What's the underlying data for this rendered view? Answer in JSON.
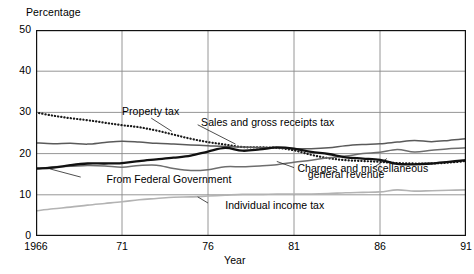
{
  "chart_data": {
    "type": "line",
    "title": "",
    "ylabel": "Percentage",
    "xlabel": "Year",
    "ylim": [
      0,
      50
    ],
    "yticks": [
      0,
      10,
      20,
      30,
      40,
      50
    ],
    "xlim": [
      1966,
      1991
    ],
    "xticks": [
      1966,
      1971,
      1976,
      1981,
      1986,
      1991
    ],
    "xtick_labels": [
      "1966",
      "71",
      "76",
      "81",
      "86",
      "91"
    ],
    "grid": true,
    "legend_position": "inline-annotations",
    "x": [
      1966,
      1967,
      1968,
      1969,
      1970,
      1971,
      1972,
      1973,
      1974,
      1975,
      1976,
      1977,
      1978,
      1979,
      1980,
      1981,
      1982,
      1983,
      1984,
      1985,
      1986,
      1987,
      1988,
      1989,
      1990,
      1991
    ],
    "series": [
      {
        "name": "Property tax",
        "style": "dotted",
        "color": "#1a1a1a",
        "values": [
          30.0,
          29.2,
          28.6,
          28.1,
          27.5,
          26.9,
          26.4,
          25.6,
          24.6,
          23.6,
          22.8,
          22.2,
          21.6,
          21.5,
          21.4,
          20.8,
          19.7,
          18.9,
          18.4,
          18.2,
          18.0,
          17.7,
          17.6,
          17.6,
          17.8,
          18.2
        ]
      },
      {
        "name": "Sales and gross receipts tax",
        "style": "solid-gray",
        "color": "#5a5a5a",
        "values": [
          22.6,
          22.4,
          22.5,
          22.3,
          22.7,
          23.0,
          22.8,
          22.5,
          22.3,
          22.1,
          21.9,
          21.7,
          21.6,
          21.5,
          21.4,
          21.2,
          21.2,
          21.4,
          21.9,
          22.2,
          22.4,
          22.8,
          23.2,
          22.9,
          23.2,
          23.6
        ]
      },
      {
        "name": "Charges and miscellaneous general revenue",
        "style": "solid-medium-gray",
        "color": "#6e6e6e",
        "values": [
          16.2,
          16.8,
          16.9,
          17.1,
          17.0,
          16.7,
          17.1,
          17.2,
          16.4,
          15.9,
          16.1,
          16.8,
          16.8,
          17.0,
          17.3,
          17.9,
          18.4,
          19.0,
          19.4,
          20.0,
          20.3,
          21.0,
          20.4,
          20.8,
          21.2,
          21.4
        ]
      },
      {
        "name": "From Federal Government",
        "style": "solid-black-thick",
        "color": "#111111",
        "values": [
          16.4,
          16.6,
          17.2,
          17.6,
          17.6,
          17.7,
          18.2,
          18.6,
          19.0,
          19.5,
          20.5,
          21.4,
          20.7,
          21.0,
          21.5,
          21.2,
          20.4,
          19.9,
          19.1,
          18.8,
          18.5,
          17.5,
          17.4,
          17.6,
          18.0,
          18.4
        ]
      },
      {
        "name": "Individual income tax",
        "style": "solid-light-gray",
        "color": "#b3b3b3",
        "values": [
          6.1,
          6.6,
          7.0,
          7.5,
          7.9,
          8.3,
          8.8,
          9.1,
          9.4,
          9.5,
          9.7,
          9.9,
          10.1,
          10.1,
          10.2,
          10.2,
          10.2,
          10.3,
          10.5,
          10.6,
          10.7,
          11.2,
          10.9,
          11.0,
          11.1,
          11.2
        ]
      }
    ],
    "annotations": [
      {
        "text": "Property tax",
        "x": 1971.0,
        "y": 30.0
      },
      {
        "text": "Sales and gross receipts tax",
        "x": 1975.6,
        "y": 27.5
      },
      {
        "text": "Charges and miscellaneous",
        "x": 1981.2,
        "y": 16.2
      },
      {
        "text": "general revenue",
        "x": 1981.8,
        "y": 14.7
      },
      {
        "text": "From Federal Government",
        "x": 1970.1,
        "y": 13.6
      },
      {
        "text": "Individual income tax",
        "x": 1977.0,
        "y": 7.2
      }
    ]
  }
}
